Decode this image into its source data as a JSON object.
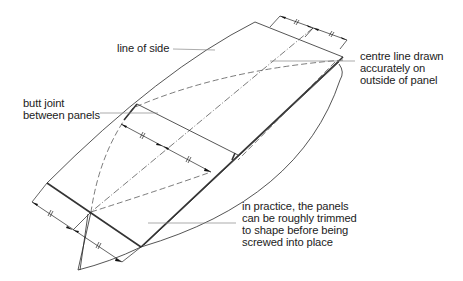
{
  "diagram": {
    "colors": {
      "line": "#2a2a2a",
      "leader": "#888888",
      "text": "#222222",
      "background": "#ffffff"
    },
    "labels": {
      "line_of_side": "line of side",
      "centre_line": "centre line drawn\naccurately on\noutside of panel",
      "butt_joint": "butt joint\nbetween panels",
      "in_practice": "in practice, the panels\ncan be roughly trimmed\nto shape before being\nscrewed into place"
    },
    "dimension_marks": [
      {
        "position": "top-edge",
        "halves": 2,
        "equal_marks": "//"
      },
      {
        "position": "butt-joint",
        "halves": 2,
        "equal_marks": "//"
      },
      {
        "position": "bottom-edge",
        "halves": 2,
        "equal_marks": "//"
      }
    ]
  }
}
